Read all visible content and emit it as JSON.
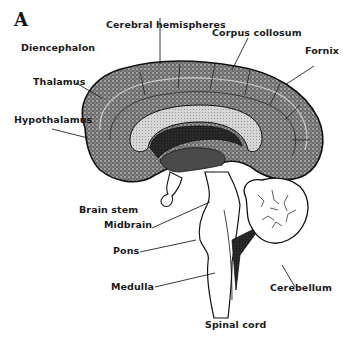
{
  "figure": {
    "panel_label": "A",
    "labels": {
      "diencephalon": "Diencephalon",
      "cerebral_hemispheres": "Cerebral hemispheres",
      "corpus_collosum": "Corpus collosum",
      "fornix": "Fornix",
      "thalamus": "Thalamus",
      "hypothalamus": "Hypothalamus",
      "brain_stem": "Brain stem",
      "midbrain": "Midbrain",
      "pons": "Pons",
      "medulla": "Medulla",
      "cerebellum": "Cerebellum",
      "spinal_cord": "Spinal cord"
    }
  }
}
